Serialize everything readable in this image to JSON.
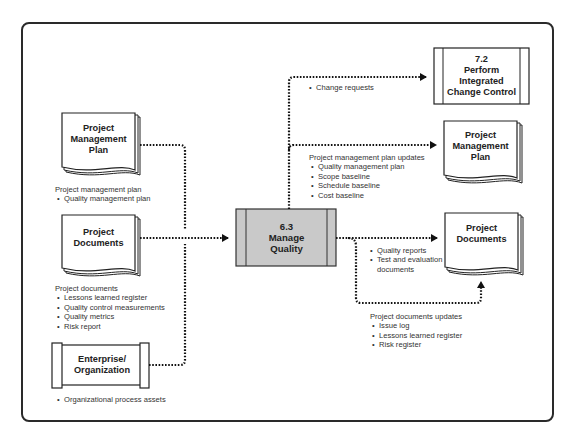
{
  "diagram": {
    "type": "process-flow",
    "process": {
      "number": "6.3",
      "name_line1": "Manage",
      "name_line2": "Quality",
      "fill_color": "#c9c9c9"
    },
    "inputs": [
      {
        "id": "pmp-input",
        "shape": "document",
        "title_lines": [
          "Project",
          "Management",
          "Plan"
        ],
        "caption_heading": "Project management plan",
        "caption_items": [
          "Quality management plan"
        ]
      },
      {
        "id": "pd-input",
        "shape": "document",
        "title_lines": [
          "Project",
          "Documents"
        ],
        "caption_heading": "Project documents",
        "caption_items": [
          "Lessons learned register",
          "Quality control measurements",
          "Quality metrics",
          "Risk report"
        ]
      },
      {
        "id": "eo-input",
        "shape": "scroll",
        "title_lines": [
          "Enterprise/",
          "Organization"
        ],
        "caption_items": [
          "Organizational process assets"
        ]
      }
    ],
    "outputs": [
      {
        "id": "icc-output",
        "shape": "process",
        "title_lines": [
          "7.2",
          "Perform",
          "Integrated",
          "Change Control"
        ],
        "caption_items": [
          "Change requests"
        ]
      },
      {
        "id": "pmp-output",
        "shape": "document",
        "title_lines": [
          "Project",
          "Management",
          "Plan"
        ],
        "caption_heading": "Project management plan updates",
        "caption_items": [
          "Quality management plan",
          "Scope baseline",
          "Schedule baseline",
          "Cost baseline"
        ]
      },
      {
        "id": "pd-output",
        "shape": "document",
        "title_lines": [
          "Project",
          "Documents"
        ],
        "caption_items": [
          "Quality reports",
          "Test and evaluation",
          "documents"
        ],
        "caption2_heading": "Project documents updates",
        "caption2_items": [
          "Issue log",
          "Lessons learned register",
          "Risk register"
        ]
      }
    ],
    "colors": {
      "line": "#111111",
      "frame": "#2a2a2a",
      "process_fill": "#c9c9c9",
      "text": "#333333"
    }
  }
}
